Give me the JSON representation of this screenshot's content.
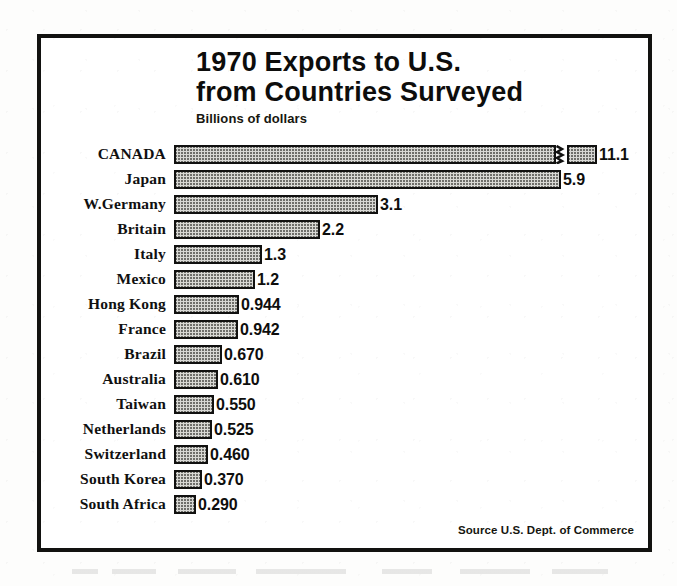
{
  "chart_data": {
    "type": "bar",
    "orientation": "horizontal",
    "title": "1970 Exports to U.S.",
    "title_line1": "1970 Exports to U.S.",
    "title_line2": "from Countries Surveyed",
    "subtitle": "Billions of dollars",
    "xlabel": "Billions of dollars",
    "ylabel": "",
    "units": "billions of U.S. dollars",
    "grid": false,
    "legend": false,
    "xlim": [
      0,
      11.1
    ],
    "axis_break": {
      "present": true,
      "applies_to": "CANADA",
      "note": "CANADA bar is drawn with a break symbol; its true length is compressed"
    },
    "source": "Source U.S. Dept. of Commerce",
    "categories": [
      "CANADA",
      "Japan",
      "W.Germany",
      "Britain",
      "Italy",
      "Mexico",
      "Hong Kong",
      "France",
      "Brazil",
      "Australia",
      "Taiwan",
      "Netherlands",
      "Switzerland",
      "South Korea",
      "South Africa"
    ],
    "values": [
      11.1,
      5.9,
      3.1,
      2.2,
      1.3,
      1.2,
      0.944,
      0.942,
      0.67,
      0.61,
      0.55,
      0.525,
      0.46,
      0.37,
      0.29
    ],
    "value_labels": [
      "11.1",
      "5.9",
      "3.1",
      "2.2",
      "1.3",
      "1.2",
      "0.944",
      "0.942",
      "0.670",
      "0.610",
      "0.550",
      "0.525",
      "0.460",
      "0.370",
      "0.290"
    ],
    "rows": [
      {
        "label": "CANADA",
        "value": 11.1,
        "value_label": "11.1",
        "bar_px": 382,
        "stub_px": 30,
        "broken": true
      },
      {
        "label": "Japan",
        "value": 5.9,
        "value_label": "5.9",
        "bar_px": 387,
        "stub_px": 0,
        "broken": false
      },
      {
        "label": "W.Germany",
        "value": 3.1,
        "value_label": "3.1",
        "bar_px": 204,
        "stub_px": 0,
        "broken": false
      },
      {
        "label": "Britain",
        "value": 2.2,
        "value_label": "2.2",
        "bar_px": 146,
        "stub_px": 0,
        "broken": false
      },
      {
        "label": "Italy",
        "value": 1.3,
        "value_label": "1.3",
        "bar_px": 88,
        "stub_px": 0,
        "broken": false
      },
      {
        "label": "Mexico",
        "value": 1.2,
        "value_label": "1.2",
        "bar_px": 81,
        "stub_px": 0,
        "broken": false
      },
      {
        "label": "Hong Kong",
        "value": 0.944,
        "value_label": "0.944",
        "bar_px": 65,
        "stub_px": 0,
        "broken": false
      },
      {
        "label": "France",
        "value": 0.942,
        "value_label": "0.942",
        "bar_px": 64,
        "stub_px": 0,
        "broken": false
      },
      {
        "label": "Brazil",
        "value": 0.67,
        "value_label": "0.670",
        "bar_px": 48,
        "stub_px": 0,
        "broken": false
      },
      {
        "label": "Australia",
        "value": 0.61,
        "value_label": "0.610",
        "bar_px": 44,
        "stub_px": 0,
        "broken": false
      },
      {
        "label": "Taiwan",
        "value": 0.55,
        "value_label": "0.550",
        "bar_px": 40,
        "stub_px": 0,
        "broken": false
      },
      {
        "label": "Netherlands",
        "value": 0.525,
        "value_label": "0.525",
        "bar_px": 38,
        "stub_px": 0,
        "broken": false
      },
      {
        "label": "Switzerland",
        "value": 0.46,
        "value_label": "0.460",
        "bar_px": 34,
        "stub_px": 0,
        "broken": false
      },
      {
        "label": "South Korea",
        "value": 0.37,
        "value_label": "0.370",
        "bar_px": 28,
        "stub_px": 0,
        "broken": false
      },
      {
        "label": "South Africa",
        "value": 0.29,
        "value_label": "0.290",
        "bar_px": 22,
        "stub_px": 0,
        "broken": false
      }
    ],
    "colors": {
      "ink": "#111110",
      "bar_fill": "#d8d8d4",
      "bar_hatch": "#6e6e6a",
      "paper": "#ffffff"
    }
  }
}
